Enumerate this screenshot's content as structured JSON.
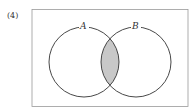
{
  "problem": {
    "number": "(4)"
  },
  "diagram": {
    "type": "venn",
    "sets": [
      {
        "name": "A",
        "cx": 84,
        "cy": 62,
        "r": 35
      },
      {
        "name": "B",
        "cx": 136,
        "cy": 62,
        "r": 35
      }
    ],
    "shaded_region": "A ∩ B",
    "shade_color": "#c8c8c8",
    "stroke_color": "#333333",
    "frame_color": "#999999"
  }
}
